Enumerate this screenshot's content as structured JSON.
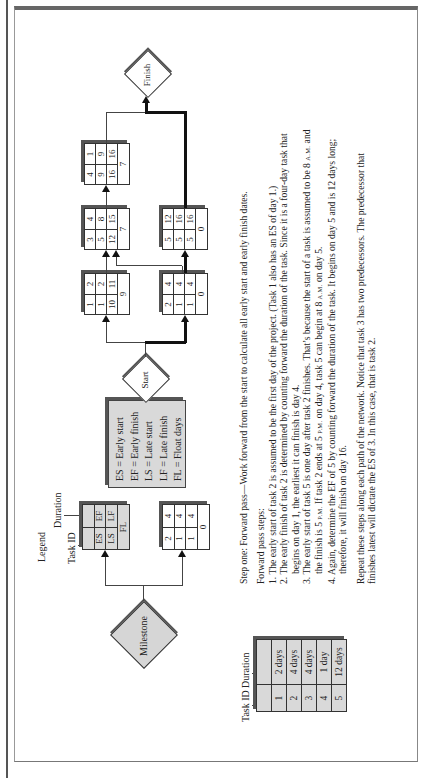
{
  "legend": {
    "title": "Legend",
    "task_id_label": "Task ID",
    "duration_label": "Duration",
    "cells": {
      "es": "ES",
      "ef": "EF",
      "ls": "LS",
      "lf": "LF",
      "fl": "FL"
    },
    "definitions": [
      "ES = Early start",
      "EF = Early finish",
      "LS = Late start",
      "LF = Late finish",
      "FL = Float days"
    ]
  },
  "milestones": {
    "milestone": "Milestone",
    "start": "Start",
    "finish": "Finish"
  },
  "example_box": {
    "id": "2",
    "dur": "4",
    "es": "1",
    "ef": "4",
    "ls": "1",
    "lf": "4",
    "fl": "0"
  },
  "tasks": [
    {
      "id": "1",
      "dur": "2",
      "es": "1",
      "ef": "2",
      "ls": "10",
      "lf": "11",
      "fl": "9"
    },
    {
      "id": "2",
      "dur": "4",
      "es": "1",
      "ef": "4",
      "ls": "1",
      "lf": "4",
      "fl": "0"
    },
    {
      "id": "3",
      "dur": "4",
      "es": "5",
      "ef": "8",
      "ls": "12",
      "lf": "15",
      "fl": "7"
    },
    {
      "id": "4",
      "dur": "1",
      "es": "9",
      "ef": "9",
      "ls": "16",
      "lf": "16",
      "fl": "7"
    },
    {
      "id": "5",
      "dur": "12",
      "es": "5",
      "ef": "16",
      "ls": "5",
      "lf": "16",
      "fl": "0"
    }
  ],
  "duration_table": {
    "task_id_label": "Task ID",
    "duration_label": "Duration",
    "rows": [
      {
        "id": "1",
        "duration": "2 days"
      },
      {
        "id": "2",
        "duration": "4 days"
      },
      {
        "id": "3",
        "duration": "4 days"
      },
      {
        "id": "4",
        "duration": "1 day"
      },
      {
        "id": "5",
        "duration": "12 days"
      }
    ]
  },
  "text": {
    "step_one": "Step one: Forward pass—Work forward from the start to calculate all early start and early finish dates.",
    "steps_heading": "Forward pass steps:",
    "step1": "1. The early start of task 2 is assumed to be the first day of the project. (Task 1 also has an ES of day 1.)",
    "step2a": "2. The early finish of task 2 is determined by counting forward the duration of the task. Since it is a four-day task that",
    "step2b": "begins on day 1, the earliest it can finish is day 4.",
    "step3a_pre": "3. The early start of task 5 is one day after task 2 finishes. That’s because the start of a task is assumed to be 8",
    "step3a_am": "A.M.",
    "step3a_post": " and",
    "step3b_pre": "the finish is 5",
    "step3b_pm": "P.M.",
    "step3b_mid": " If task 2 ends at 5",
    "step3b_pm2": "P.M.",
    "step3b_mid2": " on day 4, task 5 can begin at 8",
    "step3b_am": "A.M.",
    "step3b_post": " on day 5.",
    "step4a": "4. Again, determine the EF of 5 by counting forward the duration of the task. It begins on day 5 and is 12 days long;",
    "step4b": "therefore, it will finish on day 16.",
    "repeat_a": "Repeat these steps along each path of the network. Notice that task 3 has two predecessors. The predecessor that",
    "repeat_b": "finishes latest will dictate the ES of 3. In this case, that is task 2."
  }
}
